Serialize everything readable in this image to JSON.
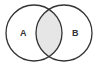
{
  "diagram": {
    "type": "venn",
    "sets": [
      {
        "label": "A",
        "cx": 34,
        "cy": 33,
        "r": 28
      },
      {
        "label": "B",
        "cx": 64,
        "cy": 33,
        "r": 28
      }
    ],
    "highlighted_region": "A ∩ B",
    "colors": {
      "stroke": "#333333",
      "intersection_fill": "#e6e6e6",
      "background": "#ffffff"
    }
  }
}
